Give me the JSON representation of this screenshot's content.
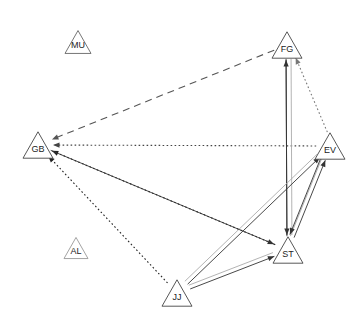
{
  "diagram": {
    "type": "directed-network-graph",
    "title": "",
    "background_color": "#ffffff",
    "node_shape": "triangle",
    "nodes": [
      {
        "id": "MU",
        "label": "MU",
        "x": 78,
        "y": 42,
        "size": 26,
        "outline_color": "#666666",
        "isolated": true
      },
      {
        "id": "FG",
        "label": "FG",
        "x": 287,
        "y": 45,
        "size": 30,
        "outline_color": "#444444",
        "isolated": false
      },
      {
        "id": "GB",
        "label": "GB",
        "x": 38,
        "y": 145,
        "size": 30,
        "outline_color": "#444444",
        "isolated": false
      },
      {
        "id": "EV",
        "label": "EV",
        "x": 330,
        "y": 146,
        "size": 30,
        "outline_color": "#444444",
        "isolated": false
      },
      {
        "id": "AL",
        "label": "AL",
        "x": 76,
        "y": 248,
        "size": 24,
        "outline_color": "#999999",
        "isolated": true
      },
      {
        "id": "ST",
        "label": "ST",
        "x": 288,
        "y": 250,
        "size": 30,
        "outline_color": "#444444",
        "isolated": false
      },
      {
        "id": "JJ",
        "label": "JJ",
        "x": 177,
        "y": 293,
        "size": 30,
        "outline_color": "#444444",
        "isolated": false
      }
    ],
    "edges": [
      {
        "from": "FG",
        "to": "GB",
        "style": "dashed",
        "color": "#555555",
        "arrow": true,
        "offset": 0
      },
      {
        "from": "EV",
        "to": "GB",
        "style": "dotted",
        "color": "#444444",
        "arrow": true,
        "offset": 0
      },
      {
        "from": "EV",
        "to": "FG",
        "style": "dotted",
        "color": "#777777",
        "arrow": true,
        "offset": 3
      },
      {
        "from": "FG",
        "to": "ST",
        "style": "solid",
        "color": "#aaaaaa",
        "arrow": false,
        "offset": -4
      },
      {
        "from": "ST",
        "to": "FG",
        "style": "solid",
        "color": "#333333",
        "arrow": true,
        "offset": -1
      },
      {
        "from": "FG",
        "to": "ST",
        "style": "solid",
        "color": "#333333",
        "arrow": true,
        "offset": 1
      },
      {
        "from": "ST",
        "to": "EV",
        "style": "solid",
        "color": "#aaaaaa",
        "arrow": false,
        "offset": -3
      },
      {
        "from": "ST",
        "to": "EV",
        "style": "solid",
        "color": "#333333",
        "arrow": true,
        "offset": 1
      },
      {
        "from": "EV",
        "to": "ST",
        "style": "solid",
        "color": "#333333",
        "arrow": true,
        "offset": 4
      },
      {
        "from": "JJ",
        "to": "EV",
        "style": "solid",
        "color": "#aaaaaa",
        "arrow": false,
        "offset": -3
      },
      {
        "from": "JJ",
        "to": "EV",
        "style": "solid",
        "color": "#333333",
        "arrow": true,
        "offset": 1
      },
      {
        "from": "JJ",
        "to": "ST",
        "style": "solid",
        "color": "#aaaaaa",
        "arrow": false,
        "offset": -3
      },
      {
        "from": "JJ",
        "to": "ST",
        "style": "solid",
        "color": "#333333",
        "arrow": true,
        "offset": 1
      },
      {
        "from": "JJ",
        "to": "GB",
        "style": "dotted",
        "color": "#222222",
        "arrow": true,
        "offset": 0
      },
      {
        "from": "ST",
        "to": "GB",
        "style": "dotted",
        "color": "#222222",
        "arrow": true,
        "offset": 0
      },
      {
        "from": "GB",
        "to": "ST",
        "style": "solid",
        "color": "#333333",
        "arrow": true,
        "offset": 0
      }
    ]
  }
}
